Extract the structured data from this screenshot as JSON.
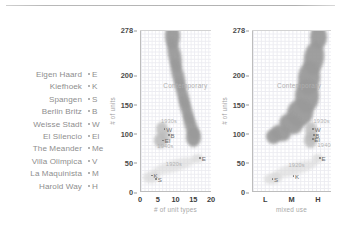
{
  "figure": {
    "legend_title": "",
    "projects": [
      {
        "name": "Eigen Haard",
        "abbr": "E"
      },
      {
        "name": "Kiefhoek",
        "abbr": "K"
      },
      {
        "name": "Spangen",
        "abbr": "S"
      },
      {
        "name": "Berlin Britz",
        "abbr": "B"
      },
      {
        "name": "Weisse Stadt",
        "abbr": "W"
      },
      {
        "name": "El Silencio",
        "abbr": "El"
      },
      {
        "name": "The Meander",
        "abbr": "Me"
      },
      {
        "name": "Villa Olimpica",
        "abbr": "V"
      },
      {
        "name": "La Maquinista",
        "abbr": "M"
      },
      {
        "name": "Harold Way",
        "abbr": "H"
      }
    ],
    "colors": {
      "blob": "#9a9a9a",
      "blob_light": "#d8d8d8",
      "grid": "#e9e9ef",
      "axis": "#bdbdbd",
      "label": "#8e8e8e",
      "tick": "#4a4a4a"
    }
  },
  "chart_data": [
    {
      "type": "scatter",
      "id": "chart1",
      "title": "",
      "xlabel": "# of unit types",
      "ylabel": "# of units",
      "xticks": [
        "0",
        "5",
        "10",
        "15",
        "20"
      ],
      "xtick_values": [
        0,
        5,
        10,
        15,
        20
      ],
      "yticks": [
        "0",
        "50",
        "100",
        "150",
        "200",
        "278"
      ],
      "ytick_values": [
        0,
        50,
        100,
        150,
        200,
        278
      ],
      "xlim": [
        0,
        20
      ],
      "ylim": [
        0,
        278
      ],
      "grid": true,
      "points": [
        {
          "label": "K",
          "x": 2.4,
          "y": 28
        },
        {
          "label": "S",
          "x": 3.6,
          "y": 22
        },
        {
          "label": "E",
          "x": 16.0,
          "y": 58
        },
        {
          "label": "W",
          "x": 6.0,
          "y": 108
        },
        {
          "label": "B",
          "x": 7.2,
          "y": 97
        },
        {
          "label": "El",
          "x": 5.6,
          "y": 88
        }
      ],
      "annotations": [
        {
          "text": "Contemporary",
          "x": 12.5,
          "y": 183
        },
        {
          "text": "1930s",
          "x": 5.6,
          "y": 122
        },
        {
          "text": "1940s",
          "x": 4.6,
          "y": 79
        },
        {
          "text": "1920s",
          "x": 7.0,
          "y": 48
        }
      ]
    },
    {
      "type": "scatter",
      "id": "chart2",
      "title": "",
      "xlabel": "mixed use",
      "ylabel": "# of units",
      "xticks": [
        "L",
        "M",
        "H"
      ],
      "xtick_values": [
        0,
        1,
        2
      ],
      "yticks": [
        "0",
        "50",
        "100",
        "150",
        "200",
        "278"
      ],
      "ytick_values": [
        0,
        50,
        100,
        150,
        200,
        278
      ],
      "xlim": [
        -0.5,
        2.5
      ],
      "ylim": [
        0,
        278
      ],
      "grid": true,
      "points": [
        {
          "label": "S",
          "x": 0.15,
          "y": 22
        },
        {
          "label": "K",
          "x": 0.95,
          "y": 27
        },
        {
          "label": "E",
          "x": 1.95,
          "y": 58
        },
        {
          "label": "W",
          "x": 1.7,
          "y": 108
        },
        {
          "label": "B",
          "x": 1.72,
          "y": 97
        },
        {
          "label": "El",
          "x": 1.68,
          "y": 90
        }
      ],
      "annotations": [
        {
          "text": "Contemporary",
          "x": 1.25,
          "y": 183
        },
        {
          "text": "1930s",
          "x": 1.8,
          "y": 122
        },
        {
          "text": "1940s",
          "x": 1.95,
          "y": 80
        },
        {
          "text": "1920s",
          "x": 0.85,
          "y": 46
        }
      ]
    }
  ]
}
